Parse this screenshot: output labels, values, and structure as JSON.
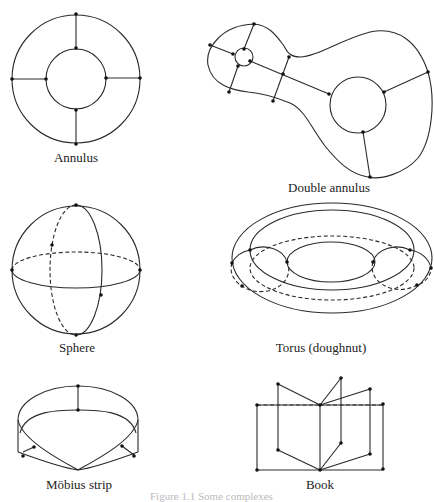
{
  "figure": {
    "stroke_color": "#2a2a2a",
    "background": "#ffffff",
    "surfaces": [
      {
        "id": "annulus",
        "label": "Annulus"
      },
      {
        "id": "double-annulus",
        "label": "Double annulus"
      },
      {
        "id": "sphere",
        "label": "Sphere"
      },
      {
        "id": "torus",
        "label": "Torus (doughnut)"
      },
      {
        "id": "mobius-strip",
        "label": "Möbius strip"
      },
      {
        "id": "book",
        "label": "Book"
      }
    ],
    "caption": "Figure 1.1  Some complexes"
  }
}
